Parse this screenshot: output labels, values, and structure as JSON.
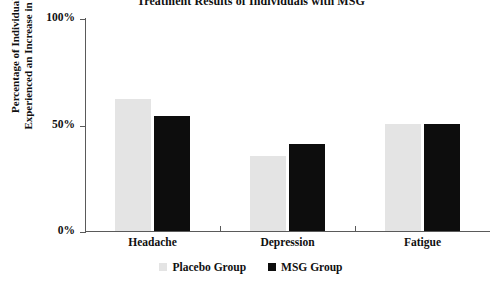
{
  "chart_data": {
    "type": "bar",
    "title": "Treatment Results of Individuals with MSG",
    "xlabel": "",
    "ylabel_line1": "Percentage of Individuals who",
    "ylabel_line2": "Experienced an Increase in Symptom",
    "categories": [
      "Headache",
      "Depression",
      "Fatigue"
    ],
    "series": [
      {
        "name": "Placebo Group",
        "color": "#e4e4e4",
        "values": [
          62,
          35,
          50
        ]
      },
      {
        "name": "MSG Group",
        "color": "#0d0d0d",
        "values": [
          54,
          41,
          50
        ]
      }
    ],
    "ylim": [
      0,
      100
    ],
    "yticks": [
      {
        "value": 100,
        "label": "100%"
      },
      {
        "value": 50,
        "label": "50%"
      },
      {
        "value": 0,
        "label": "0%"
      }
    ],
    "grid": false,
    "legend_position": "bottom-center"
  }
}
